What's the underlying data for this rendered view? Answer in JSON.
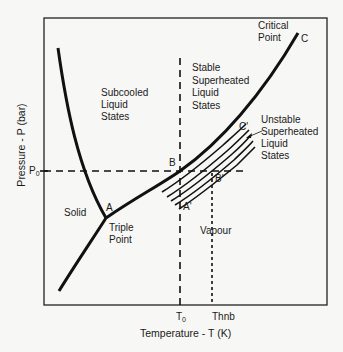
{
  "diagram": {
    "type": "phase_diagram",
    "axes": {
      "xlabel": "Temperature - T (K)",
      "ylabel": "Pressure - P (bar)",
      "x_ticks": [
        {
          "label": "T",
          "sub": "0"
        },
        {
          "label": "Thnb"
        }
      ],
      "y_ticks": [
        {
          "label": "P",
          "sub": "0"
        }
      ]
    },
    "points": {
      "A": "A",
      "A_prime": "A'",
      "B": "B",
      "B_prime": "B'",
      "C": "C",
      "C_prime": "C'",
      "triple_point": [
        "Triple",
        "Point"
      ],
      "critical_point": [
        "Critical",
        "Point"
      ]
    },
    "regions": {
      "solid": "Solid",
      "vapour": "Vapour",
      "subcooled": [
        "Subcooled",
        "Liquid",
        "States"
      ],
      "stable_superheated": [
        "Stable",
        "Superheated",
        "Liquid",
        "States"
      ],
      "unstable_superheated": [
        "Unstable",
        "Superheated",
        "Liquid",
        "States"
      ]
    },
    "curves": [
      {
        "name": "melting-curve",
        "from": "top-left",
        "to": "A"
      },
      {
        "name": "sublimation-curve",
        "from": "A",
        "to": "bottom-left"
      },
      {
        "name": "vapour-pressure-curve",
        "from": "A",
        "via": "B",
        "to": "C"
      },
      {
        "name": "metastable-hatch",
        "from": "A'",
        "via": "B'",
        "to": "C'",
        "lines": 5
      }
    ],
    "reference_lines": [
      {
        "name": "T0",
        "orientation": "vertical",
        "style": "dashed"
      },
      {
        "name": "P0",
        "orientation": "horizontal",
        "style": "dashed"
      },
      {
        "name": "Thnb",
        "orientation": "vertical",
        "style": "dotted"
      }
    ],
    "colors": {
      "background": "#f7f7f5",
      "ink": "#111111"
    }
  }
}
